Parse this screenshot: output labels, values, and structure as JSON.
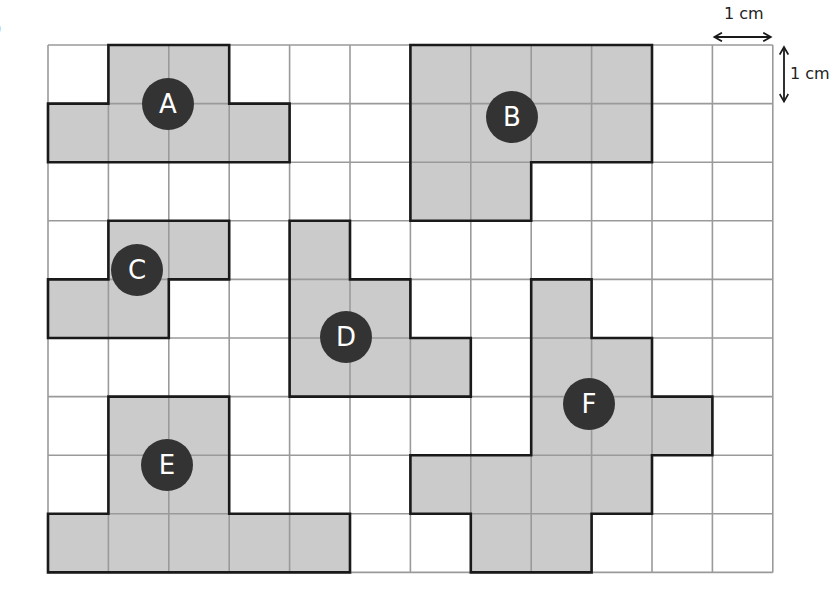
{
  "figure": {
    "part_label": ")",
    "grid": {
      "cols": 12,
      "rows": 9,
      "origin_x": 48,
      "origin_y": 45,
      "cell_w": 60.4,
      "cell_h": 58.6,
      "grid_line_color": "#9a9a9a",
      "outline_color": "#1a1a1a",
      "fill_color": "#cbcbcb"
    },
    "scale": {
      "horizontal_label": "1 cm",
      "vertical_label": "1 cm"
    },
    "shapes": [
      {
        "id": "A",
        "label": "A",
        "cells": [
          [
            0,
            1
          ],
          [
            0,
            2
          ],
          [
            1,
            0
          ],
          [
            1,
            1
          ],
          [
            1,
            2
          ],
          [
            1,
            3
          ]
        ],
        "marker": {
          "x": 168,
          "y": 104
        }
      },
      {
        "id": "B",
        "label": "B",
        "cells": [
          [
            0,
            6
          ],
          [
            0,
            7
          ],
          [
            0,
            8
          ],
          [
            0,
            9
          ],
          [
            1,
            6
          ],
          [
            1,
            7
          ],
          [
            1,
            8
          ],
          [
            1,
            9
          ],
          [
            2,
            6
          ],
          [
            2,
            7
          ]
        ],
        "marker": {
          "x": 512,
          "y": 117
        }
      },
      {
        "id": "C",
        "label": "C",
        "cells": [
          [
            3,
            1
          ],
          [
            3,
            2
          ],
          [
            4,
            0
          ],
          [
            4,
            1
          ]
        ],
        "marker": {
          "x": 137,
          "y": 270
        }
      },
      {
        "id": "D",
        "label": "D",
        "cells": [
          [
            3,
            4
          ],
          [
            4,
            4
          ],
          [
            4,
            5
          ],
          [
            5,
            4
          ],
          [
            5,
            5
          ],
          [
            5,
            6
          ]
        ],
        "marker": {
          "x": 346,
          "y": 337
        }
      },
      {
        "id": "E",
        "label": "E",
        "cells": [
          [
            6,
            1
          ],
          [
            6,
            2
          ],
          [
            7,
            1
          ],
          [
            7,
            2
          ],
          [
            8,
            0
          ],
          [
            8,
            1
          ],
          [
            8,
            2
          ],
          [
            8,
            3
          ],
          [
            8,
            4
          ]
        ],
        "marker": {
          "x": 167,
          "y": 465
        }
      },
      {
        "id": "F",
        "label": "F",
        "cells": [
          [
            4,
            8
          ],
          [
            5,
            8
          ],
          [
            5,
            9
          ],
          [
            6,
            8
          ],
          [
            6,
            9
          ],
          [
            6,
            10
          ],
          [
            7,
            6
          ],
          [
            7,
            7
          ],
          [
            7,
            8
          ],
          [
            7,
            9
          ],
          [
            8,
            7
          ],
          [
            8,
            8
          ]
        ],
        "marker": {
          "x": 589,
          "y": 404
        }
      }
    ],
    "marker_style": {
      "radius": 26,
      "fill": "#333333",
      "text_color": "#ffffff"
    }
  }
}
